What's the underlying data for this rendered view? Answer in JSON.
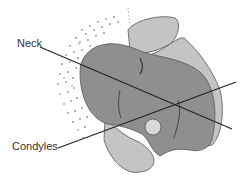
{
  "figure": {
    "type": "anatomical-diagram",
    "labels": [
      {
        "id": "neck",
        "text": "Neck"
      },
      {
        "id": "condyles",
        "text": "Condyles"
      }
    ],
    "colors": {
      "bone_dark": "#8f8f8f",
      "bone_light": "#c4c4c4",
      "outline": "#555555",
      "stipple": "#9a9a9a",
      "line": "#222222"
    }
  }
}
